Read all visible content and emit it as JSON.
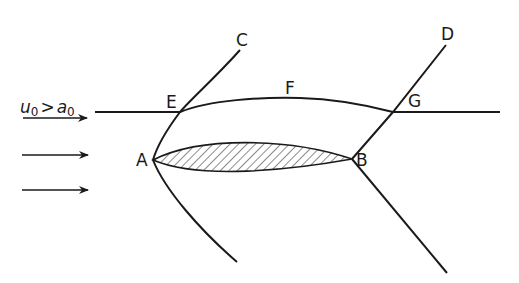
{
  "diagram": {
    "flow_condition": {
      "u": "u",
      "u_sub": "0",
      "op": ">",
      "a": "a",
      "a_sub": "0"
    },
    "points": {
      "A": {
        "label": "A",
        "x": 153,
        "y": 160
      },
      "B": {
        "label": "B",
        "x": 352,
        "y": 159
      },
      "C": {
        "label": "C",
        "x": 240,
        "y": 50
      },
      "D": {
        "label": "D",
        "x": 446,
        "y": 45
      },
      "E": {
        "label": "E",
        "x": 180,
        "y": 112
      },
      "F": {
        "label": "F",
        "x": 290,
        "y": 98
      },
      "G": {
        "label": "G",
        "x": 393,
        "y": 112
      }
    },
    "arrows": [
      {
        "x1": 23,
        "y1": 118,
        "x2": 87,
        "y2": 118
      },
      {
        "x1": 22,
        "y1": 155,
        "x2": 88,
        "y2": 155
      },
      {
        "x1": 22,
        "y1": 190,
        "x2": 88,
        "y2": 190
      }
    ],
    "colors": {
      "ink": "#1a1a1a",
      "background": "#ffffff"
    }
  }
}
